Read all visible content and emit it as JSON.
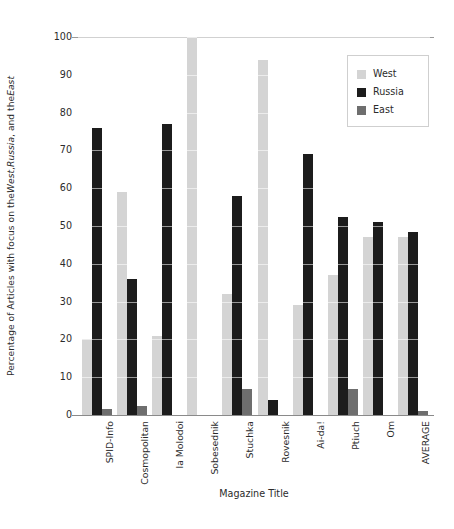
{
  "chart_data": {
    "type": "bar",
    "title": "",
    "subtitle": "",
    "xlabel": "Magazine Title",
    "ylabel_plain": "Percentage of Articles with focus on the West, Russia, and the East",
    "ylabel_parts": [
      {
        "text": "Percentage of Articles with focus on the ",
        "italic": false
      },
      {
        "text": "West",
        "italic": true
      },
      {
        "text": ", ",
        "italic": false
      },
      {
        "text": "Russia",
        "italic": true
      },
      {
        "text": ", and the ",
        "italic": false
      },
      {
        "text": "East",
        "italic": true
      }
    ],
    "ylim": [
      0,
      100
    ],
    "ytick_labels": [
      "0",
      "10",
      "20",
      "30",
      "40",
      "50",
      "60",
      "70",
      "80",
      "90",
      "100"
    ],
    "ytick_values": [
      0,
      10,
      20,
      30,
      40,
      50,
      60,
      70,
      80,
      90,
      100
    ],
    "grid": "horizontal-faint-over-bars",
    "legend_position": "top-right-inside",
    "categories": [
      "SPID-Info",
      "Cosmopolitan",
      "la Molodoi",
      "Sobesednik",
      "Stuchka",
      "Rovesnik",
      "Ai-da!",
      "Ptiuch",
      "Om",
      "AVERAGE"
    ],
    "series": [
      {
        "name": "West",
        "color": "#d4d4d4",
        "values": [
          20,
          59,
          21,
          100,
          32,
          94,
          29,
          37,
          47,
          47
        ]
      },
      {
        "name": "Russia",
        "color": "#1c1c1c",
        "values": [
          76,
          36,
          77,
          0,
          58,
          4,
          69,
          52.5,
          51,
          48.5
        ]
      },
      {
        "name": "East",
        "color": "#6e6e6e",
        "values": [
          1.5,
          2.5,
          0,
          0,
          7,
          0,
          0,
          7,
          0,
          1
        ]
      }
    ]
  },
  "legend": {
    "entries": [
      {
        "label": "West",
        "color": "#d4d4d4"
      },
      {
        "label": "Russia",
        "color": "#1c1c1c"
      },
      {
        "label": "East",
        "color": "#6e6e6e"
      }
    ]
  }
}
